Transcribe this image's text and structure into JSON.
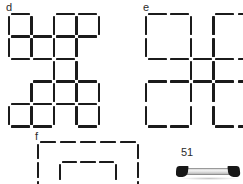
{
  "page": {
    "background_color": "#ffffff",
    "stroke_color": "#1b1b1b",
    "page_number": "51"
  },
  "panels": [
    {
      "id": "d",
      "label": "d",
      "label_x": 6,
      "label_y": 2,
      "origin_x": 9,
      "origin_y": 14,
      "cell": 22.5,
      "cols": 5,
      "rows": 5,
      "description": "staircase cluster of unit squares",
      "cells": [
        {
          "c": 0,
          "r": 0
        },
        {
          "c": 2,
          "r": 0
        },
        {
          "c": 3,
          "r": 0
        },
        {
          "c": 0,
          "r": 1
        },
        {
          "c": 1,
          "r": 1
        },
        {
          "c": 2,
          "r": 1
        },
        {
          "c": 2,
          "r": 2
        },
        {
          "c": 1,
          "r": 3
        },
        {
          "c": 2,
          "r": 3
        },
        {
          "c": 3,
          "r": 3
        },
        {
          "c": 0,
          "r": 4
        },
        {
          "c": 1,
          "r": 4
        },
        {
          "c": 3,
          "r": 4
        }
      ]
    },
    {
      "id": "e",
      "label": "e",
      "label_x": 143,
      "label_y": 2,
      "origin_x": 146,
      "origin_y": 14,
      "big": 45,
      "small": 22.5,
      "description": "four large squares around a small central square",
      "cells": [
        {
          "c": 0,
          "r": 0,
          "size": "big"
        },
        {
          "c": 1,
          "r": 0,
          "size": "big"
        },
        {
          "c": 0,
          "r": 1,
          "size": "big"
        },
        {
          "c": 1,
          "r": 1,
          "size": "big"
        },
        {
          "c": 0,
          "r": 0,
          "size": "small-center"
        }
      ]
    },
    {
      "id": "f",
      "label": "f",
      "label_x": 35,
      "label_y": 131,
      "origin_x": 38,
      "origin_y": 142,
      "description": "nested rectangles, outer and inner",
      "rects": [
        {
          "x": 0,
          "y": 0,
          "w": 100,
          "h": 56
        },
        {
          "x": 22,
          "y": 20,
          "w": 56,
          "h": 40
        }
      ]
    }
  ],
  "photo": {
    "name": "metal-bar-photograph",
    "x": 176,
    "y": 163,
    "width": 66,
    "height": 21
  }
}
